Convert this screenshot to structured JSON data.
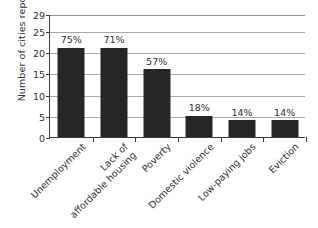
{
  "chart_data": {
    "type": "bar",
    "title": "",
    "subtitle": "",
    "xlabel": "",
    "ylabel": "Number of cities reporting",
    "ylim": [
      0,
      29
    ],
    "yticks": [
      0,
      5,
      10,
      15,
      20,
      25,
      29
    ],
    "ytick_labels": [
      "0",
      "5",
      "10",
      "15",
      "20",
      "25",
      "29"
    ],
    "grid": true,
    "legend": false,
    "orientation": "vertical",
    "bar_color": "#262626",
    "categories": [
      "Unemployment",
      "Lack of\naffordable housing",
      "Poverty",
      "Domestic violence",
      "Low-paying jobs",
      "Eviction"
    ],
    "values": [
      21,
      21,
      16,
      5,
      4,
      4
    ],
    "data_labels": [
      "75%",
      "71%",
      "57%",
      "18%",
      "14%",
      "14%"
    ],
    "points": [
      {
        "category": "Unemployment",
        "value": 21,
        "label": "75%"
      },
      {
        "category": "Lack of affordable housing",
        "value": 21,
        "label": "71%"
      },
      {
        "category": "Poverty",
        "value": 16,
        "label": "57%"
      },
      {
        "category": "Domestic violence",
        "value": 5,
        "label": "18%"
      },
      {
        "category": "Low-paying jobs",
        "value": 4,
        "label": "14%"
      },
      {
        "category": "Eviction",
        "value": 4,
        "label": "14%"
      }
    ]
  },
  "colors": {
    "bar": "#262626",
    "axis": "#3a3a3a",
    "grid": "#a8a8a8",
    "text": "#2f2f2f",
    "background": "#ffffff"
  }
}
